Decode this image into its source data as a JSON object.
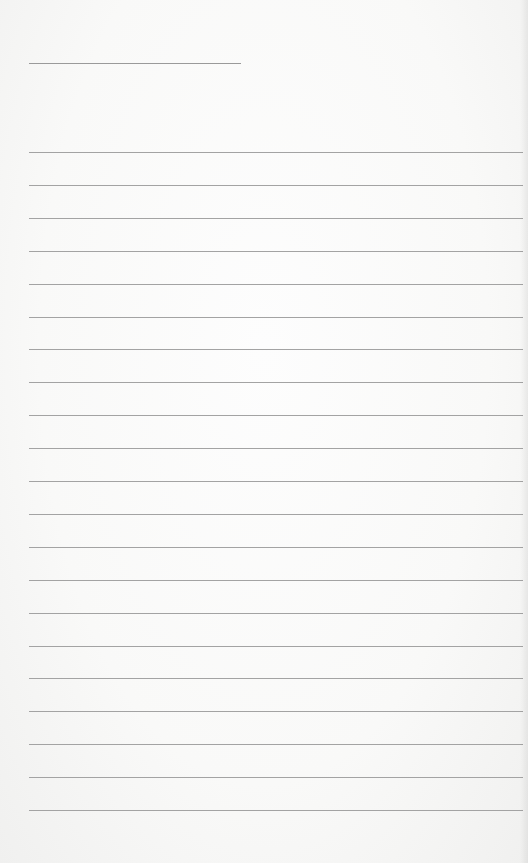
{
  "page": {
    "type": "lined-notepaper",
    "title_line": {
      "text": ""
    },
    "lines": [
      {
        "text": ""
      },
      {
        "text": ""
      },
      {
        "text": ""
      },
      {
        "text": ""
      },
      {
        "text": ""
      },
      {
        "text": ""
      },
      {
        "text": ""
      },
      {
        "text": ""
      },
      {
        "text": ""
      },
      {
        "text": ""
      },
      {
        "text": ""
      },
      {
        "text": ""
      },
      {
        "text": ""
      },
      {
        "text": ""
      },
      {
        "text": ""
      },
      {
        "text": ""
      },
      {
        "text": ""
      },
      {
        "text": ""
      },
      {
        "text": ""
      },
      {
        "text": ""
      },
      {
        "text": ""
      }
    ],
    "colors": {
      "paper": "#f9f9f8",
      "rule": "#a3a3a3"
    }
  }
}
